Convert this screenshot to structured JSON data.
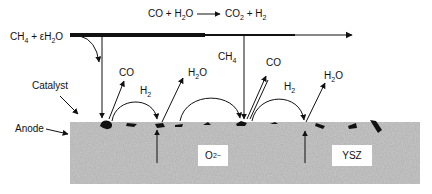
{
  "diagram": {
    "title_reaction": {
      "lhs": "CO + H",
      "lhs_sub": "2",
      "lhs_tail": "O",
      "rhs": "CO",
      "rhs_sub": "2",
      "rhs_tail": " + H",
      "rhs_sub2": "2"
    },
    "feed": {
      "text": "CH",
      "sub1": "4",
      "mid": " + εH",
      "sub2": "2",
      "tail": "O"
    },
    "labels": {
      "catalyst": "Catalyst",
      "anode": "Anode",
      "oxide_ion": "O",
      "oxide_ion_sup": "2−",
      "electrolyte": "YSZ",
      "ch4_mid": "CH",
      "ch4_mid_sub": "4"
    },
    "products": [
      {
        "id": "co-1",
        "text": "CO"
      },
      {
        "id": "h2-1",
        "text": "H",
        "sub": "2"
      },
      {
        "id": "h2o-1",
        "text": "H",
        "sub": "2",
        "tail": "O"
      },
      {
        "id": "co-2",
        "text": "CO"
      },
      {
        "id": "h2-2",
        "text": "H",
        "sub": "2"
      },
      {
        "id": "h2o-2",
        "text": "H",
        "sub": "2",
        "tail": "O"
      }
    ],
    "colors": {
      "line": "#111111",
      "anode_fill": "#b8b8b8",
      "catalyst": "#111111",
      "background": "#ffffff"
    }
  }
}
